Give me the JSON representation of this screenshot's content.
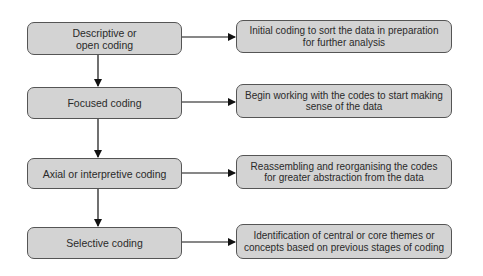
{
  "diagram": {
    "stages": [
      {
        "label": "Descriptive or open coding",
        "lines": [
          "Descriptive or",
          "open coding"
        ],
        "description_lines": [
          "Initial coding to sort the data in preparation",
          "for further analysis"
        ]
      },
      {
        "label": "Focused coding",
        "lines": [
          "Focused coding"
        ],
        "description_lines": [
          "Begin working with the codes to start making",
          "sense of the data"
        ]
      },
      {
        "label": "Axial or interpretive coding",
        "lines": [
          "Axial or interpretive coding"
        ],
        "description_lines": [
          "Reassembling and reorganising the codes",
          "for greater abstraction from the data"
        ]
      },
      {
        "label": "Selective coding",
        "lines": [
          "Selective coding"
        ],
        "description_lines": [
          "Identification of central or core themes or",
          "concepts based on previous stages of coding"
        ]
      }
    ],
    "colors": {
      "box_fill": "#d3d3d3",
      "border": "#555555",
      "arrow": "#111111",
      "text": "#2a2a2a"
    }
  }
}
